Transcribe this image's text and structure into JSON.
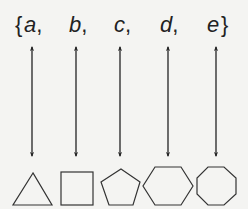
{
  "diagram": {
    "set": {
      "open_brace": "{",
      "close_brace": "}",
      "elements": [
        {
          "label": "a",
          "suffix": ",",
          "x": 32
        },
        {
          "label": "b",
          "suffix": ",",
          "x": 76
        },
        {
          "label": "c",
          "suffix": ",",
          "x": 119
        },
        {
          "label": "d",
          "suffix": ",",
          "x": 167
        },
        {
          "label": "e",
          "suffix": "",
          "x": 215
        }
      ]
    },
    "connector": "double-headed-arrow",
    "shapes": [
      {
        "name": "triangle",
        "sides": 3
      },
      {
        "name": "square",
        "sides": 4
      },
      {
        "name": "pentagon",
        "sides": 5
      },
      {
        "name": "hexagon",
        "sides": 6
      },
      {
        "name": "octagon",
        "sides": 8
      }
    ],
    "colors": {
      "ink": "#222222",
      "background": "#f4f4f2"
    }
  }
}
